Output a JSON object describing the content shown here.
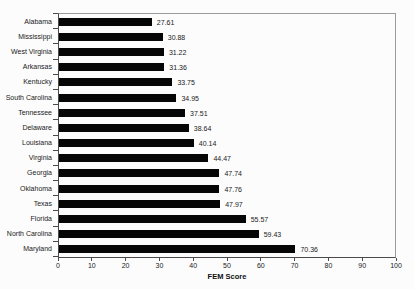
{
  "chart_data": {
    "type": "bar",
    "orientation": "horizontal",
    "title": "",
    "xlabel": "FEM Score",
    "ylabel": "",
    "xlim": [
      0,
      100
    ],
    "xticks": [
      0,
      10,
      20,
      30,
      40,
      50,
      60,
      70,
      80,
      90,
      100
    ],
    "grid": false,
    "legend": false,
    "bar_color": "#060606",
    "frame_color": "#9b9b9b",
    "axis_color": "#4a4a4a",
    "categories": [
      "Alabama",
      "Mississippi",
      "West Virginia",
      "Arkansas",
      "Kentucky",
      "South Carolina",
      "Tennessee",
      "Delaware",
      "Louisiana",
      "Virginia",
      "Georgia",
      "Oklahoma",
      "Texas",
      "Florida",
      "North Carolina",
      "Maryland"
    ],
    "values": [
      27.61,
      30.88,
      31.22,
      31.36,
      33.75,
      34.95,
      37.51,
      38.64,
      40.14,
      44.47,
      47.74,
      47.76,
      47.97,
      55.57,
      59.43,
      70.36
    ],
    "value_labels": [
      "27.61",
      "30.88",
      "31.22",
      "31.36",
      "33.75",
      "34.95",
      "37.51",
      "38.64",
      "40.14",
      "44.47",
      "47.74",
      "47.76",
      "47.97",
      "55.57",
      "59.43",
      "70.36"
    ]
  }
}
